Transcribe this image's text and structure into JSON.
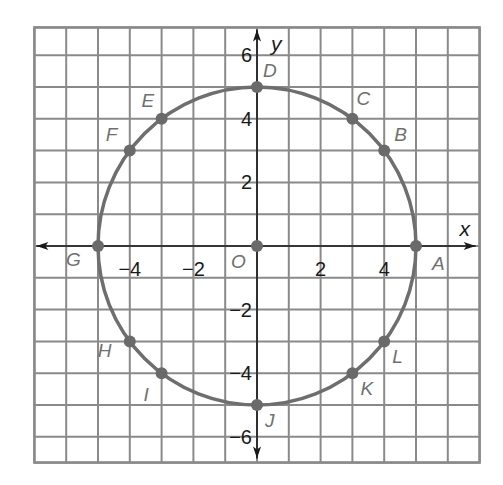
{
  "chart_data": {
    "type": "scatter",
    "title": "",
    "xlabel": "x",
    "ylabel": "y",
    "xlim": [
      -7,
      7
    ],
    "ylim": [
      -7,
      7
    ],
    "grid": true,
    "grid_step": 1,
    "x_ticks": [
      -4,
      -2,
      2,
      4
    ],
    "x_tick_labels": [
      "−4",
      "−2",
      "2",
      "4"
    ],
    "y_ticks": [
      6,
      4,
      2,
      -2,
      -4,
      -6
    ],
    "y_tick_labels": [
      "6",
      "4",
      "2",
      "−2",
      "−4",
      "−6"
    ],
    "origin_label": "O",
    "circle": {
      "center": [
        0,
        0
      ],
      "radius": 5
    },
    "points": [
      {
        "label": "A",
        "x": 5,
        "y": 0
      },
      {
        "label": "B",
        "x": 4,
        "y": 3
      },
      {
        "label": "C",
        "x": 3,
        "y": 4
      },
      {
        "label": "D",
        "x": 0,
        "y": 5
      },
      {
        "label": "E",
        "x": -3,
        "y": 4
      },
      {
        "label": "F",
        "x": -4,
        "y": 3
      },
      {
        "label": "G",
        "x": -5,
        "y": 0
      },
      {
        "label": "H",
        "x": -4,
        "y": -3
      },
      {
        "label": "I",
        "x": -3,
        "y": -4
      },
      {
        "label": "J",
        "x": 0,
        "y": -5
      },
      {
        "label": "K",
        "x": 3,
        "y": -4
      },
      {
        "label": "L",
        "x": 4,
        "y": -3
      },
      {
        "label": "O",
        "x": 0,
        "y": 0
      }
    ],
    "colors": {
      "circle": "#6e6e6e",
      "grid": "#8a8a8a",
      "axis": "#1a1a1a",
      "point_label": "#707070",
      "tick_label": "#1a1a1a"
    }
  }
}
